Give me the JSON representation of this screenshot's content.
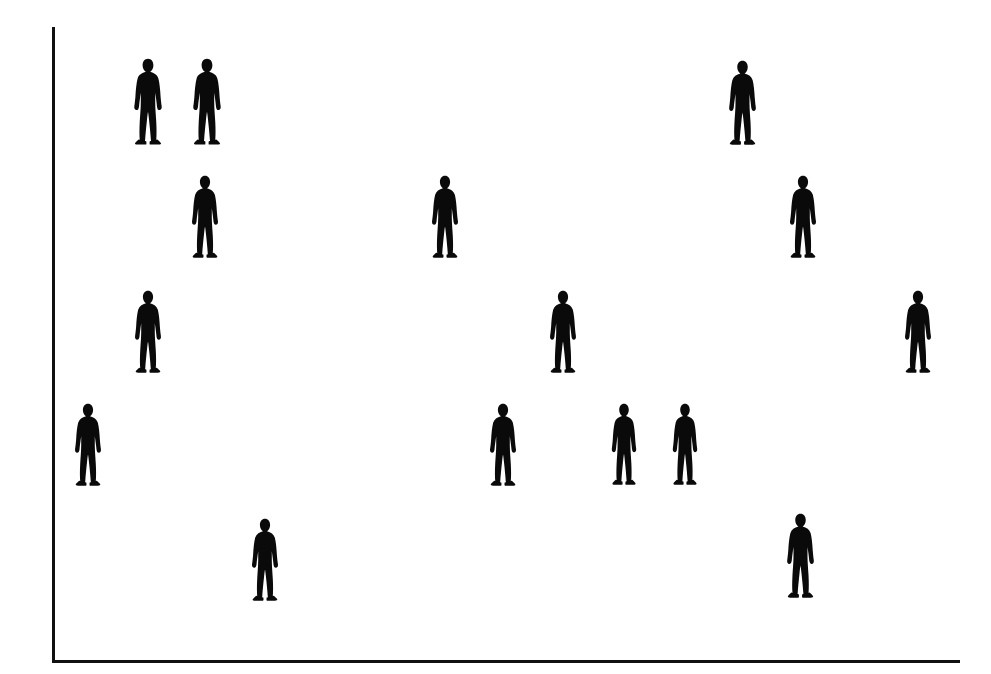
{
  "canvas": {
    "width": 991,
    "height": 674,
    "background_color": "#ffffff"
  },
  "axes": {
    "line_color": "#111111",
    "line_width": 3,
    "origin_x": 52,
    "origin_y": 660,
    "y_axis_top": 27,
    "x_axis_right": 960,
    "title": "",
    "x_label": "",
    "y_label": "",
    "x_tick_labels": [],
    "y_tick_labels": [],
    "grid": false,
    "legend": ""
  },
  "marker": {
    "icon_name": "person-standing-icon",
    "color": "#0a0a0a",
    "count_label": "16"
  },
  "chart_data": {
    "type": "scatter",
    "title": "",
    "xlabel": "",
    "ylabel": "",
    "grid": false,
    "legend_position": "none",
    "xlim": [
      52,
      960
    ],
    "ylim": [
      27,
      660
    ],
    "marker_style": "person-pictogram",
    "point_count": 16,
    "series": [
      {
        "name": "people",
        "marker": "person-standing-icon",
        "color": "#0a0a0a",
        "points": [
          {
            "id": "p1",
            "x": 148,
            "y": 58,
            "w": 36,
            "h": 88
          },
          {
            "id": "p2",
            "x": 207,
            "y": 58,
            "w": 36,
            "h": 88
          },
          {
            "id": "p3",
            "x": 742,
            "y": 60,
            "w": 35,
            "h": 86
          },
          {
            "id": "p4",
            "x": 205,
            "y": 175,
            "w": 34,
            "h": 84
          },
          {
            "id": "p5",
            "x": 445,
            "y": 175,
            "w": 34,
            "h": 84
          },
          {
            "id": "p6",
            "x": 803,
            "y": 175,
            "w": 34,
            "h": 84
          },
          {
            "id": "p7",
            "x": 148,
            "y": 290,
            "w": 34,
            "h": 84
          },
          {
            "id": "p8",
            "x": 563,
            "y": 290,
            "w": 34,
            "h": 84
          },
          {
            "id": "p9",
            "x": 918,
            "y": 290,
            "w": 34,
            "h": 84
          },
          {
            "id": "p10",
            "x": 88,
            "y": 403,
            "w": 34,
            "h": 84
          },
          {
            "id": "p11",
            "x": 503,
            "y": 403,
            "w": 34,
            "h": 84
          },
          {
            "id": "p12",
            "x": 624,
            "y": 403,
            "w": 32,
            "h": 83
          },
          {
            "id": "p13",
            "x": 685,
            "y": 403,
            "w": 32,
            "h": 83
          },
          {
            "id": "p14",
            "x": 265,
            "y": 518,
            "w": 34,
            "h": 84
          },
          {
            "id": "p15",
            "x": 800,
            "y": 513,
            "w": 35,
            "h": 86
          }
        ]
      }
    ]
  }
}
